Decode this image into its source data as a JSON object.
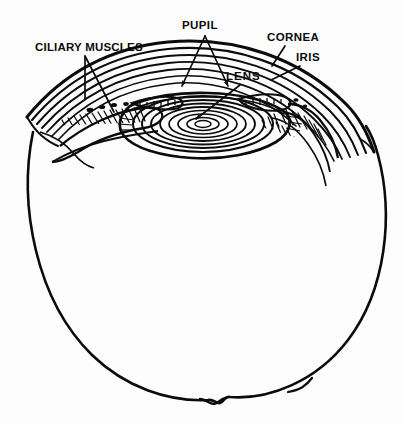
{
  "diagram": {
    "background_color": "#fdfdfd",
    "ink_color": "#0b0b0b",
    "labels": {
      "ciliary_muscles": "CILIARY MUSCLES",
      "pupil": "PUPIL",
      "cornea": "CORNEA",
      "iris": "IRIS",
      "lens": "LENS"
    },
    "structures": [
      {
        "name": "eyeball-sclera",
        "description": "large outer circle of the eyeball"
      },
      {
        "name": "cornea",
        "description": "layered transparent dome at the top front"
      },
      {
        "name": "lens",
        "description": "concentric elliptical fibre rings below the pupil"
      },
      {
        "name": "iris",
        "description": "hatched tissue flanking the pupil opening"
      },
      {
        "name": "ciliary-muscles",
        "description": "hatched muscle tissue at the left and right lens margins"
      },
      {
        "name": "pupil",
        "description": "central opening between the iris edges"
      },
      {
        "name": "optic-nerve-notch",
        "description": "small notch at the bottom of the eyeball"
      }
    ],
    "leader_lines": [
      {
        "label": "ciliary_muscles",
        "targets": 2,
        "style": "plain"
      },
      {
        "label": "pupil",
        "targets": 2,
        "style": "arrow"
      },
      {
        "label": "cornea",
        "targets": 1,
        "style": "plain"
      },
      {
        "label": "iris",
        "targets": 1,
        "style": "plain"
      },
      {
        "label": "lens",
        "targets": 1,
        "style": "arrow"
      }
    ]
  }
}
